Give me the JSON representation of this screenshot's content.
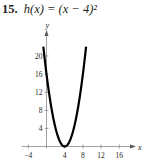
{
  "problem": {
    "number": "15.",
    "function": "h(x) = (x − 4)²"
  },
  "chart_data": {
    "type": "line",
    "title": "h(x) = (x − 4)²",
    "xlabel": "x",
    "ylabel": "y",
    "xlim": [
      -5,
      19
    ],
    "ylim": [
      0,
      23
    ],
    "x_ticks": [
      -4,
      4,
      8,
      12,
      16
    ],
    "y_ticks": [
      4,
      8,
      12,
      16,
      20
    ],
    "grid": false,
    "series": [
      {
        "name": "h(x) = (x − 4)²",
        "equation": "(x - 4)^2",
        "x": [
          -0.7,
          0,
          1,
          2,
          3,
          4,
          5,
          6,
          7,
          8,
          8.7
        ],
        "y": [
          22.09,
          16,
          9,
          4,
          1,
          0,
          1,
          4,
          9,
          16,
          22.09
        ],
        "color": "#000000"
      }
    ]
  }
}
